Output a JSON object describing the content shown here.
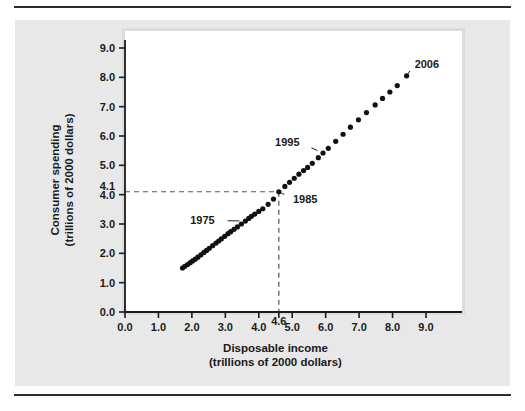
{
  "figure": {
    "background": "#e8e8e8",
    "plot_background": "#ffffff",
    "rule_color": "#2b2b2b"
  },
  "chart_data": {
    "type": "scatter",
    "title": "",
    "xlabel": "Disposable income",
    "xlabel_sub": "(trillions of 2000 dollars)",
    "ylabel": "Consumer spending",
    "ylabel_sub": "(trillions of 2000 dollars)",
    "xlim": [
      0.0,
      9.0
    ],
    "ylim": [
      0.0,
      9.0
    ],
    "grid": false,
    "legend": "none",
    "marker_color": "#111111",
    "xticks": [
      "0.0",
      "1.0",
      "2.0",
      "3.0",
      "4.0",
      "5.0",
      "6.0",
      "7.0",
      "8.0",
      "9.0"
    ],
    "xtick_values": [
      0,
      1,
      2,
      3,
      4,
      5,
      6,
      7,
      8,
      9
    ],
    "yticks": [
      "0.0",
      "1.0",
      "2.0",
      "3.0",
      "4.0",
      "5.0",
      "6.0",
      "7.0",
      "8.0",
      "9.0"
    ],
    "ytick_values": [
      0,
      1,
      2,
      3,
      4,
      5,
      6,
      7,
      8,
      9
    ],
    "special_xtick": {
      "label": "4.6",
      "value": 4.6
    },
    "special_ytick": {
      "label": "4.1",
      "value": 4.1
    },
    "guide_lines": {
      "x": 4.6,
      "y": 4.1,
      "style": "dashed",
      "color": "#555555"
    },
    "x": [
      1.72,
      1.79,
      1.87,
      1.95,
      2.02,
      2.1,
      2.18,
      2.27,
      2.36,
      2.44,
      2.52,
      2.62,
      2.72,
      2.8,
      2.88,
      2.98,
      3.08,
      3.16,
      3.26,
      3.36,
      3.48,
      3.6,
      3.7,
      3.78,
      3.88,
      4.0,
      4.12,
      4.28,
      4.44,
      4.6,
      4.78,
      4.92,
      5.06,
      5.2,
      5.34,
      5.46,
      5.6,
      5.78,
      5.92,
      6.08,
      6.3,
      6.52,
      6.74,
      6.98,
      7.22,
      7.48,
      7.7,
      7.92,
      8.14,
      8.42
    ],
    "y": [
      1.5,
      1.56,
      1.62,
      1.68,
      1.74,
      1.8,
      1.87,
      1.95,
      2.03,
      2.1,
      2.17,
      2.26,
      2.35,
      2.42,
      2.49,
      2.58,
      2.67,
      2.74,
      2.82,
      2.9,
      3.0,
      3.1,
      3.19,
      3.26,
      3.34,
      3.43,
      3.52,
      3.67,
      3.85,
      4.1,
      4.28,
      4.42,
      4.56,
      4.7,
      4.82,
      4.93,
      5.07,
      5.26,
      5.42,
      5.58,
      5.82,
      6.06,
      6.3,
      6.55,
      6.8,
      7.06,
      7.28,
      7.5,
      7.72,
      8.05
    ],
    "annotations": [
      {
        "label": "1975",
        "text_x": 2.68,
        "text_y": 3.12,
        "point_x": 3.6,
        "point_y": 3.1,
        "anchor": "end"
      },
      {
        "label": "1985",
        "text_x": 5.02,
        "text_y": 3.86,
        "point_x": 4.6,
        "point_y": 4.1,
        "anchor": "start"
      },
      {
        "label": "1995",
        "text_x": 5.22,
        "text_y": 5.78,
        "point_x": 5.92,
        "point_y": 5.42,
        "anchor": "end"
      },
      {
        "label": "2006",
        "text_x": 8.66,
        "text_y": 8.46,
        "point_x": 8.42,
        "point_y": 8.05,
        "anchor": "start"
      }
    ]
  }
}
